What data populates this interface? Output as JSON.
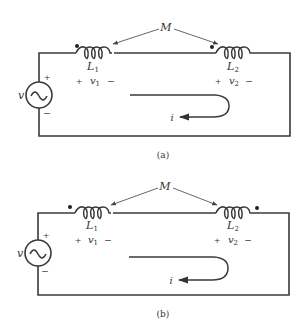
{
  "figures": [
    {
      "id": "a",
      "caption": "(a)",
      "mutual_label": "M",
      "source_label": "v",
      "source_plus": "+",
      "source_minus": "−",
      "inductor1": {
        "label": "L",
        "sub": "1",
        "v_label": "v",
        "v_sub": "1",
        "plus": "+",
        "minus": "−",
        "dot_side": "left"
      },
      "inductor2": {
        "label": "L",
        "sub": "2",
        "v_label": "v",
        "v_sub": "2",
        "plus": "+",
        "minus": "−",
        "dot_side": "left"
      },
      "current_label": "i"
    },
    {
      "id": "b",
      "caption": "(b)",
      "mutual_label": "M",
      "source_label": "v",
      "source_plus": "+",
      "source_minus": "−",
      "inductor1": {
        "label": "L",
        "sub": "1",
        "v_label": "v",
        "v_sub": "1",
        "plus": "+",
        "minus": "−",
        "dot_side": "left"
      },
      "inductor2": {
        "label": "L",
        "sub": "2",
        "v_label": "v",
        "v_sub": "2",
        "plus": "+",
        "minus": "−",
        "dot_side": "right"
      },
      "current_label": "i"
    }
  ],
  "colors": {
    "line": "#3a3a3a",
    "text": "#333333"
  }
}
